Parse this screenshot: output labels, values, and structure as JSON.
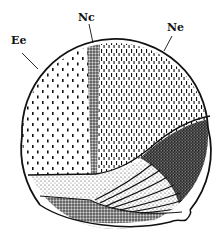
{
  "figure": {
    "labels": [
      {
        "id": "Ee",
        "text": "Ee"
      },
      {
        "id": "Nc",
        "text": "Nc"
      },
      {
        "id": "Ne",
        "text": "Ne"
      }
    ],
    "colors": {
      "ink": "#111111",
      "background": "#ffffff"
    }
  }
}
